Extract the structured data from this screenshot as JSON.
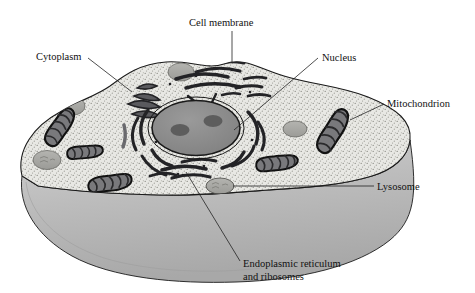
{
  "diagram": {
    "background_color": "#ffffff",
    "outline_color": "#1a1a1a"
  },
  "labels": [
    {
      "id": "cell-membrane",
      "text": "Cell membrane",
      "x": 189,
      "y": 26,
      "anchor": "start",
      "leader": "M 232,31 L 232,63"
    },
    {
      "id": "cytoplasm",
      "text": "Cytoplasm",
      "x": 36,
      "y": 60,
      "anchor": "start",
      "leader": "M 88,58 L 132,92"
    },
    {
      "id": "nucleus",
      "text": "Nucleus",
      "x": 322,
      "y": 61,
      "anchor": "start",
      "leader": "M 318,58 L 232,130"
    },
    {
      "id": "mitochondrion",
      "text": "Mitochondrion",
      "x": 387,
      "y": 106,
      "anchor": "start",
      "leader": "M 384,103 L 352,120"
    },
    {
      "id": "lysosome",
      "text": "Lysosome",
      "x": 377,
      "y": 189,
      "anchor": "start",
      "leader": "M 374,186 L 232,186"
    },
    {
      "id": "endoplasmic-reticulum",
      "text": "Endoplasmic reticulum",
      "text_line2": "and ribosomes",
      "x": 243,
      "y": 267,
      "anchor": "start",
      "leader": "M 240,262 L 186,172"
    }
  ],
  "structures": {
    "cell_membrane": {
      "name": "cell membrane",
      "fill": "#e9e9e6",
      "stroke": "#1a1a1a"
    },
    "cytoplasm": {
      "name": "cytoplasm",
      "fill": "#e3e3df",
      "texture": "stipple"
    },
    "cell_wall_side": {
      "name": "cell depth side wall",
      "fill": "#b9b9b9"
    },
    "nucleus": {
      "name": "nucleus",
      "fill": "#8d8d8d",
      "stroke": "#1a1a1a",
      "cx": 196,
      "cy": 128,
      "rx": 44,
      "ry": 27,
      "nucleoli": [
        {
          "cx": 180,
          "cy": 128,
          "rx": 9,
          "ry": 6
        },
        {
          "cx": 212,
          "cy": 122,
          "rx": 9,
          "ry": 6
        }
      ]
    },
    "mitochondria": [
      {
        "id": "mito-left-upper",
        "cx": 60,
        "cy": 127,
        "angle": -58,
        "w": 42,
        "h": 17
      },
      {
        "id": "mito-left-mid",
        "cx": 85,
        "cy": 152,
        "angle": -8,
        "w": 36,
        "h": 13
      },
      {
        "id": "mito-left-lower",
        "cx": 110,
        "cy": 183,
        "angle": -12,
        "w": 44,
        "h": 16
      },
      {
        "id": "mito-right-outer",
        "cx": 333,
        "cy": 131,
        "angle": -62,
        "w": 46,
        "h": 19
      },
      {
        "id": "mito-right-lower",
        "cx": 277,
        "cy": 163,
        "angle": -9,
        "w": 42,
        "h": 15
      }
    ],
    "lysosomes": [
      {
        "id": "lyso-top",
        "cx": 181,
        "cy": 72,
        "rx": 13,
        "ry": 9
      },
      {
        "id": "lyso-left-upper",
        "cx": 73,
        "cy": 106,
        "rx": 12,
        "ry": 9
      },
      {
        "id": "lyso-left-low",
        "cx": 47,
        "cy": 160,
        "rx": 14,
        "ry": 9
      },
      {
        "id": "lyso-right",
        "cx": 295,
        "cy": 129,
        "rx": 12,
        "ry": 8
      },
      {
        "id": "lyso-bottom",
        "cx": 220,
        "cy": 186,
        "rx": 14,
        "ry": 8
      }
    ],
    "endoplasmic_reticulum": {
      "name": "endoplasmic reticulum and ribosomes",
      "fill": "#555555",
      "stroke": "#111111"
    }
  }
}
